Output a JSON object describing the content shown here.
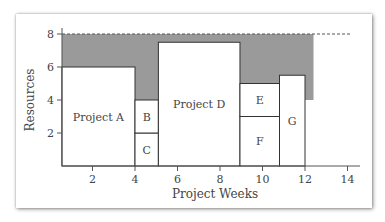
{
  "chart_data": {
    "type": "bar",
    "subtype": "resource-loading-block-chart",
    "title": "",
    "xlabel": "Project Weeks",
    "ylabel": "Resources",
    "xticks": [
      2,
      4,
      6,
      8,
      10,
      12,
      14
    ],
    "yticks": [
      2,
      4,
      6,
      8
    ],
    "xlim": [
      0.5,
      14.5
    ],
    "ylim": [
      0,
      8.5
    ],
    "grid": false,
    "resource_limit": 8,
    "blocks": [
      {
        "label": "Project A",
        "x_start": 0.56,
        "x_end": 4.0,
        "y_start": 0,
        "y_end": 6
      },
      {
        "label": "C",
        "x_start": 4.0,
        "x_end": 5.1,
        "y_start": 0,
        "y_end": 2
      },
      {
        "label": "B",
        "x_start": 4.0,
        "x_end": 5.1,
        "y_start": 2,
        "y_end": 4
      },
      {
        "label": "Project D",
        "x_start": 5.1,
        "x_end": 8.94,
        "y_start": 0,
        "y_end": 7.5
      },
      {
        "label": "F",
        "x_start": 8.94,
        "x_end": 10.8,
        "y_start": 0,
        "y_end": 3
      },
      {
        "label": "E",
        "x_start": 8.94,
        "x_end": 10.8,
        "y_start": 3,
        "y_end": 5
      },
      {
        "label": "G",
        "x_start": 10.8,
        "x_end": 12.0,
        "y_start": 0,
        "y_end": 5.5
      }
    ],
    "unused_capacity_region": {
      "color": "#9a9a9a",
      "description": "Shaded area between project blocks and resource limit of 8",
      "x_end": 12.4,
      "tail_bottom": 4
    },
    "colors": {
      "block_fill": "#ffffff",
      "block_stroke": "#333333",
      "shaded": "#9a9a9a",
      "limit_line": "#555555"
    }
  }
}
